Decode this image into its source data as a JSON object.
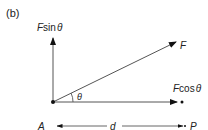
{
  "panel_label": "(b)",
  "labels": {
    "vertical_component": {
      "var": "F",
      "func": "sin",
      "angle": "θ"
    },
    "force": "F",
    "horizontal_component": {
      "var": "F",
      "func": "cos",
      "angle": "θ"
    },
    "angle": "θ",
    "point_a": "A",
    "distance": "d",
    "point_p": "P"
  },
  "colors": {
    "line": "#555555",
    "arrowhead": "#111111",
    "text": "#222222"
  }
}
